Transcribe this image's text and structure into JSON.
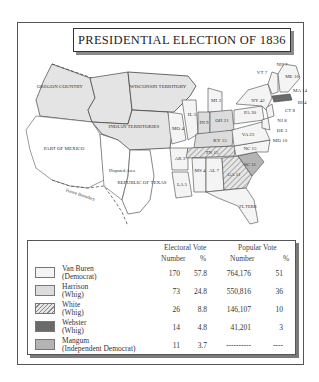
{
  "title": "PRESIDENTIAL ELECTION OF 1836",
  "map": {
    "regions": {
      "oregon": "OREGON COUNTRY",
      "wisconsin": "WISCONSIN TERRITORY",
      "indian": "INDIAN TERRITORIES",
      "mexico": "PART OF MEXICO",
      "disputed": "Disputed Area",
      "texas": "REPUBLIC OF TEXAS",
      "future_boundary": "Future Boundary",
      "fl_terr": "FL TERR"
    },
    "states": [
      {
        "abbr": "ME",
        "ev": "10"
      },
      {
        "abbr": "NH",
        "ev": "7"
      },
      {
        "abbr": "VT",
        "ev": "7"
      },
      {
        "abbr": "MA",
        "ev": "14"
      },
      {
        "abbr": "RI",
        "ev": "4"
      },
      {
        "abbr": "CT",
        "ev": "8"
      },
      {
        "abbr": "NY",
        "ev": "42"
      },
      {
        "abbr": "NJ",
        "ev": "8"
      },
      {
        "abbr": "PA",
        "ev": "30"
      },
      {
        "abbr": "DE",
        "ev": "3"
      },
      {
        "abbr": "MD",
        "ev": "10"
      },
      {
        "abbr": "VA",
        "ev": "23"
      },
      {
        "abbr": "NC",
        "ev": "15"
      },
      {
        "abbr": "SC",
        "ev": "11"
      },
      {
        "abbr": "GA",
        "ev": "11"
      },
      {
        "abbr": "AL",
        "ev": "7"
      },
      {
        "abbr": "MS",
        "ev": "4"
      },
      {
        "abbr": "LA",
        "ev": "5"
      },
      {
        "abbr": "AR",
        "ev": "3"
      },
      {
        "abbr": "MO",
        "ev": "4"
      },
      {
        "abbr": "IL",
        "ev": "5"
      },
      {
        "abbr": "IN",
        "ev": "9"
      },
      {
        "abbr": "OH",
        "ev": "21"
      },
      {
        "abbr": "KY",
        "ev": "15"
      },
      {
        "abbr": "TN",
        "ev": "15"
      },
      {
        "abbr": "MI",
        "ev": "3"
      }
    ]
  },
  "legend": {
    "headers": {
      "electoral": "Electoral Vote",
      "popular": "Popular Vote",
      "number": "Number",
      "percent": "%"
    },
    "rows": [
      {
        "name": "Van Buren",
        "party": "(Democrat)",
        "ev": "170",
        "ev_pct": "57.8",
        "pv": "764,176",
        "pv_pct": "51",
        "color": "#f4f4f4"
      },
      {
        "name": "Harrison",
        "party": "(Whig)",
        "ev": "73",
        "ev_pct": "24.8",
        "pv": "550,816",
        "pv_pct": "36",
        "color": "#dcdcdc"
      },
      {
        "name": "White",
        "party": "(Whig)",
        "ev": "26",
        "ev_pct": "8.8",
        "pv": "146,107",
        "pv_pct": "10",
        "color": "hatched"
      },
      {
        "name": "Webster",
        "party": "(Whig)",
        "ev": "14",
        "ev_pct": "4.8",
        "pv": "41,201",
        "pv_pct": "3",
        "color": "#6a6a6a"
      },
      {
        "name": "Mangum",
        "party": "(Independent Democrat)",
        "ev": "11",
        "ev_pct": "3.7",
        "pv": "----------",
        "pv_pct": "----",
        "color": "#b4b4b4"
      }
    ]
  }
}
